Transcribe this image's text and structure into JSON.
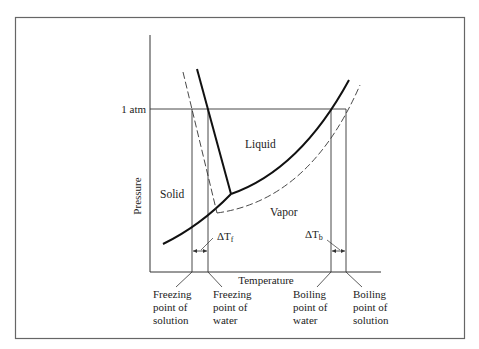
{
  "diagram": {
    "axes": {
      "x_label": "Temperature",
      "y_label": "Pressure",
      "y_tick": "1 atm"
    },
    "regions": {
      "solid": "Solid",
      "liquid": "Liquid",
      "vapor": "Vapor"
    },
    "deltas": {
      "freezing": "ΔT",
      "freezing_sub": "f",
      "boiling": "ΔT",
      "boiling_sub": "b"
    },
    "callouts": [
      {
        "line1": "Freezing",
        "line2": "point of",
        "line3": "solution"
      },
      {
        "line1": "Freezing",
        "line2": "point of",
        "line3": "water"
      },
      {
        "line1": "Boiling",
        "line2": "point of",
        "line3": "water"
      },
      {
        "line1": "Boiling",
        "line2": "point of",
        "line3": "solution"
      }
    ],
    "legend": {
      "solid_line": "pure water",
      "dashed_line": "solution"
    },
    "colors": {
      "line": "#1a1a1a",
      "frame": "#555555",
      "background": "#ffffff"
    }
  }
}
